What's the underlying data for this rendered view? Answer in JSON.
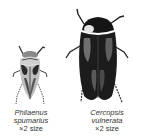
{
  "header": {
    "cutoff_text": ""
  },
  "figures": [
    {
      "name": "Philaenus spumarius",
      "genus": "Philaenus",
      "species": "spumarius",
      "scale": "×2 size"
    },
    {
      "name": "Cercopsis vulnerata",
      "genus": "Cercopsis",
      "species": "vulnerata",
      "scale": "×2 size"
    }
  ],
  "colors": {
    "background": "#ffffff",
    "insect_dark": "#1a1a1a",
    "insect_mid": "#6a6a6a",
    "insect_light": "#c8c8c8",
    "caption": "#333333"
  }
}
